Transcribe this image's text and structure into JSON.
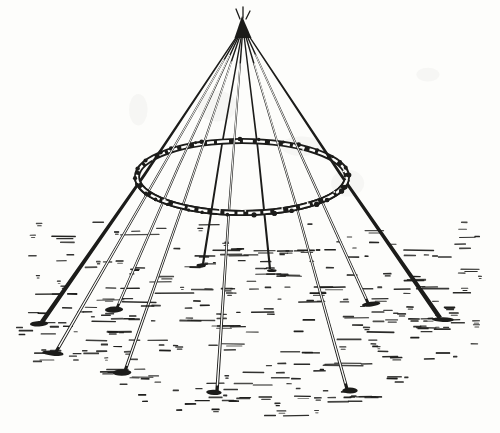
{
  "canvas": {
    "width": 500,
    "height": 433,
    "paper": "#fdfdfb",
    "ink": "#1c1c1a"
  },
  "figure": {
    "alt": "Engraved line drawing of a conical framework of slender poles lashed together at the top, bound by a twisted withe hoop part-way down, with the pole feet spread apart on ground indicated by short horizontal hatching strokes",
    "apex": {
      "x": 243,
      "y": 27,
      "cap": [
        [
          234.5,
          38
        ],
        [
          251.5,
          38
        ],
        [
          242,
          16
        ]
      ],
      "tips": [
        [
          240,
          19,
          236,
          9
        ],
        [
          243,
          18,
          243,
          7
        ],
        [
          246,
          19,
          250,
          11
        ]
      ]
    },
    "ring": {
      "cx": 242,
      "cy": 177,
      "rx": 105,
      "ry": 36,
      "band": 6,
      "core": 2.4,
      "dash": "9 4 7 3 12 5 6 3 10 4 8 5",
      "knobs": 30,
      "seed": 9
    },
    "front_poles": [
      {
        "x": 42,
        "y": 322,
        "w": 4.6,
        "hollow": false
      },
      {
        "x": 56,
        "y": 352,
        "w": 3.4,
        "hollow": true
      },
      {
        "x": 117,
        "y": 308,
        "w": 2.8,
        "hollow": true
      },
      {
        "x": 125,
        "y": 371,
        "w": 3.2,
        "hollow": true
      },
      {
        "x": 217,
        "y": 391,
        "w": 3.4,
        "hollow": true
      },
      {
        "x": 347,
        "y": 389,
        "w": 3.2,
        "hollow": true
      },
      {
        "x": 368,
        "y": 303,
        "w": 3.0,
        "hollow": true
      },
      {
        "x": 440,
        "y": 318,
        "w": 4.6,
        "hollow": false
      }
    ],
    "back_poles": [
      {
        "x": 203,
        "y": 264,
        "w": 2.2
      },
      {
        "x": 270,
        "y": 269,
        "w": 2.2
      }
    ],
    "ground": {
      "top": 223,
      "bottom": 419,
      "left": 24,
      "right": 480,
      "left_taper_start": 318,
      "left_taper_rate": 1.4,
      "right_taper_start": 345,
      "right_taper_rate": 2.1,
      "row_height": 6.4,
      "count": 285,
      "seed": 13
    },
    "blotches": {
      "count": 5,
      "seed": 4
    }
  }
}
